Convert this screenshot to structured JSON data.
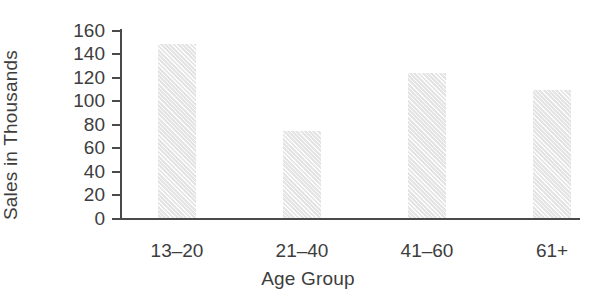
{
  "chart_data": {
    "type": "bar",
    "title": "",
    "categories": [
      "13–20",
      "21–40",
      "41–60",
      "61+"
    ],
    "values": [
      148,
      74,
      123,
      109
    ],
    "xlabel": "Age Group",
    "ylabel": "Sales in Thousands",
    "ylim": [
      0,
      160
    ],
    "ytick_labels": [
      "160",
      "140",
      "120",
      "100",
      "80",
      "60",
      "40",
      "20",
      "0"
    ],
    "ytick_values": [
      160,
      140,
      120,
      100,
      80,
      60,
      40,
      20,
      0
    ],
    "grid": false,
    "legend": null,
    "bar_color": "#e9e9e9",
    "axis_color": "#4a4a4a",
    "text_color": "#3d3d3d"
  }
}
